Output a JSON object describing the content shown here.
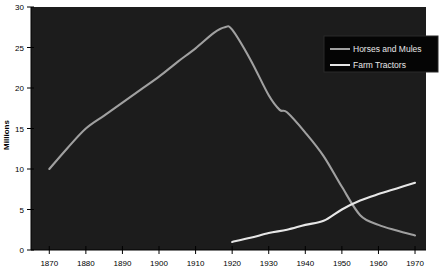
{
  "chart_data": {
    "type": "line",
    "title": "",
    "xlabel": "",
    "ylabel": "Millions",
    "xlim": [
      1865,
      1973
    ],
    "ylim": [
      0,
      30
    ],
    "grid": false,
    "legend_position": "top-right",
    "plot_background": "#1c1c1c",
    "page_background": "#ffffff",
    "x_ticks": [
      "1870",
      "1880",
      "1890",
      "1900",
      "1910",
      "1920",
      "1930",
      "1940",
      "1950",
      "1960",
      "1970"
    ],
    "y_ticks": [
      "0",
      "5",
      "10",
      "15",
      "20",
      "25",
      "30"
    ],
    "series": [
      {
        "name": "Horses and Mules",
        "color": "#a0a0a0",
        "x": [
          1870,
          1875,
          1880,
          1885,
          1890,
          1895,
          1900,
          1905,
          1910,
          1915,
          1918,
          1920,
          1925,
          1930,
          1933,
          1935,
          1940,
          1945,
          1950,
          1955,
          1960,
          1965,
          1970
        ],
        "values": [
          10.0,
          12.6,
          15.0,
          16.6,
          18.2,
          19.8,
          21.4,
          23.2,
          24.9,
          26.8,
          27.5,
          27.2,
          23.5,
          19.1,
          17.3,
          17.0,
          14.5,
          11.6,
          7.8,
          4.3,
          3.1,
          2.4,
          1.8
        ]
      },
      {
        "name": "Farm Tractors",
        "color": "#e6e6e6",
        "x": [
          1920,
          1925,
          1930,
          1935,
          1940,
          1945,
          1950,
          1955,
          1960,
          1965,
          1970
        ],
        "values": [
          1.0,
          1.5,
          2.1,
          2.5,
          3.1,
          3.6,
          5.0,
          6.1,
          6.9,
          7.6,
          8.3
        ]
      }
    ]
  },
  "legend": {
    "items": [
      {
        "label": "Horses and Mules"
      },
      {
        "label": "Farm Tractors"
      }
    ]
  },
  "axes": {
    "y_title": "Millions"
  }
}
